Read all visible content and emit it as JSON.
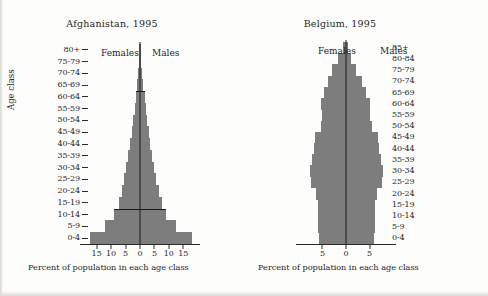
{
  "figure": {
    "background_color": "#fdfdfb",
    "bar_color": "#7d7d7d",
    "axis_color": "#1a1a1a",
    "axis_class_label": "Age class"
  },
  "panels": {
    "afghanistan": {
      "title": "Afghanistan, 1995",
      "females_label": "Females",
      "males_label": "Males",
      "x_axis_title": "Percent of population in each age class"
    },
    "belgium": {
      "title": "Belgium, 1995",
      "females_label": "Females",
      "males_label": "Males",
      "x_axis_title": "Percent of population in each age class"
    }
  },
  "chart_data": [
    {
      "type": "bar",
      "subtype": "population-pyramid",
      "title": "Afghanistan, 1995",
      "xlabel": "Percent of population in each age class",
      "ylabel": "Age class",
      "grid": false,
      "legend": "inline-annotations",
      "xlim": [
        -18,
        18
      ],
      "xticks": [
        -15,
        -10,
        -5,
        0,
        5,
        10,
        15
      ],
      "xtick_labels": [
        "15",
        "10",
        "5",
        "0",
        "5",
        "10",
        "15"
      ],
      "categories": [
        "0-4",
        "5-9",
        "10-14",
        "15-19",
        "20-24",
        "25-29",
        "30-34",
        "35-39",
        "40-44",
        "45-49",
        "50-54",
        "55-59",
        "60-64",
        "65-69",
        "70-74",
        "75-79",
        "80+"
      ],
      "series": [
        {
          "name": "Females",
          "side": "left",
          "values": [
            17.3,
            12.0,
            8.9,
            7.3,
            6.3,
            5.5,
            4.7,
            4.0,
            3.4,
            2.9,
            2.4,
            1.9,
            1.5,
            1.1,
            0.7,
            0.4,
            0.2
          ]
        },
        {
          "name": "Males",
          "side": "right",
          "values": [
            17.9,
            12.3,
            9.1,
            7.5,
            6.5,
            5.7,
            4.9,
            4.2,
            3.5,
            3.0,
            2.5,
            2.0,
            1.6,
            1.2,
            0.75,
            0.45,
            0.2
          ]
        }
      ],
      "annotations": [
        {
          "kind": "horizontal-line",
          "at_category": "15-19",
          "note": "line drawn across pyramid at top of the 10-14 class"
        },
        {
          "kind": "horizontal-line",
          "at_category": "65-69",
          "note": "line drawn across pyramid at top of the 60-64 class"
        }
      ]
    },
    {
      "type": "bar",
      "subtype": "population-pyramid",
      "title": "Belgium, 1995",
      "xlabel": "Percent of population in each age class",
      "ylabel": "Age class",
      "grid": false,
      "legend": "inline-annotations",
      "xlim": [
        -8.5,
        8.5
      ],
      "xticks": [
        -5,
        0,
        5
      ],
      "xtick_labels": [
        "5",
        "0",
        "5"
      ],
      "categories": [
        "0-4",
        "5-9",
        "10-14",
        "15-19",
        "20-24",
        "25-29",
        "30-34",
        "35-39",
        "40-44",
        "45-49",
        "50-54",
        "55-59",
        "60-64",
        "65-69",
        "70-74",
        "75-79",
        "80-84",
        "85+"
      ],
      "series": [
        {
          "name": "Females",
          "side": "left",
          "values": [
            5.8,
            5.9,
            6.0,
            6.0,
            6.4,
            7.4,
            7.7,
            7.2,
            6.8,
            6.6,
            5.4,
            5.1,
            5.3,
            4.7,
            3.9,
            2.9,
            1.7,
            0.7
          ]
        },
        {
          "name": "Males",
          "side": "right",
          "values": [
            6.0,
            6.1,
            6.2,
            6.2,
            6.6,
            7.6,
            7.9,
            7.4,
            7.0,
            6.8,
            5.6,
            5.2,
            5.1,
            4.3,
            3.3,
            2.2,
            1.1,
            0.4
          ]
        }
      ],
      "annotations": []
    }
  ]
}
